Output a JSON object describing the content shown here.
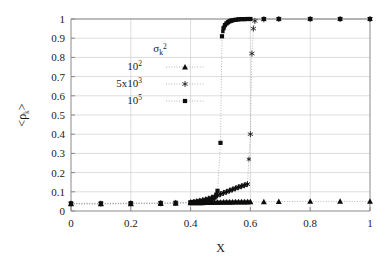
{
  "chart_data": {
    "type": "scatter",
    "title": "",
    "xlabel": "X",
    "ylabel": "<ρk>",
    "ylabel_parts": {
      "open": "<",
      "rho": "ρ",
      "sub": "k",
      "close": ">"
    },
    "xlim": [
      0,
      1
    ],
    "ylim": [
      0,
      1
    ],
    "xticks": [
      "0",
      "0.2",
      "0.4",
      "0.6",
      "0.8",
      "1"
    ],
    "xtick_values": [
      0,
      0.2,
      0.4,
      0.6,
      0.8,
      1
    ],
    "yticks": [
      "0",
      "0.1",
      "0.2",
      "0.3",
      "0.4",
      "0.5",
      "0.6",
      "0.7",
      "0.8",
      "0.9",
      "1"
    ],
    "ytick_values": [
      0,
      0.1,
      0.2,
      0.3,
      0.4,
      0.5,
      0.6,
      0.7,
      0.8,
      0.9,
      1.0
    ],
    "grid": true,
    "grid_color": "#cfcfcf",
    "legend_position": "upper-left-inside",
    "legend_title": "σk²",
    "legend_title_parts": {
      "sigma": "σ",
      "sub": "k",
      "sup": "2"
    },
    "series": [
      {
        "name": "10²",
        "name_parts": {
          "base": "10",
          "exp": "2"
        },
        "marker": "triangle",
        "color": "#0d0d0d",
        "x": [
          0.0,
          0.1,
          0.2,
          0.3,
          0.35,
          0.4,
          0.41,
          0.42,
          0.43,
          0.44,
          0.45,
          0.46,
          0.47,
          0.48,
          0.49,
          0.5,
          0.51,
          0.52,
          0.53,
          0.54,
          0.55,
          0.56,
          0.57,
          0.58,
          0.59,
          0.6,
          0.645,
          0.695,
          0.8,
          0.9,
          1.0
        ],
        "y": [
          0.037,
          0.037,
          0.038,
          0.039,
          0.04,
          0.042,
          0.042,
          0.043,
          0.043,
          0.043,
          0.044,
          0.044,
          0.044,
          0.045,
          0.045,
          0.045,
          0.046,
          0.046,
          0.046,
          0.046,
          0.047,
          0.047,
          0.047,
          0.047,
          0.047,
          0.048,
          0.048,
          0.049,
          0.05,
          0.05,
          0.05
        ]
      },
      {
        "name": "5x10³",
        "name_parts": {
          "base": "5x10",
          "exp": "3"
        },
        "marker": "star",
        "color": "#0d0d0d",
        "x": [
          0.0,
          0.1,
          0.2,
          0.3,
          0.35,
          0.4,
          0.41,
          0.42,
          0.43,
          0.44,
          0.45,
          0.46,
          0.47,
          0.48,
          0.49,
          0.5,
          0.51,
          0.52,
          0.53,
          0.54,
          0.55,
          0.56,
          0.57,
          0.58,
          0.59,
          0.6,
          0.605,
          0.61,
          0.615,
          0.645,
          0.695,
          0.8,
          0.9,
          1.0
        ],
        "y": [
          0.038,
          0.038,
          0.039,
          0.04,
          0.042,
          0.045,
          0.047,
          0.05,
          0.053,
          0.056,
          0.06,
          0.064,
          0.069,
          0.075,
          0.081,
          0.088,
          0.094,
          0.1,
          0.106,
          0.112,
          0.118,
          0.124,
          0.129,
          0.134,
          0.14,
          0.4,
          0.82,
          0.95,
          0.99,
          0.998,
          1.0,
          1.0,
          1.0,
          1.0
        ]
      },
      {
        "name": "10⁵",
        "name_parts": {
          "base": "10",
          "exp": "5"
        },
        "marker": "square",
        "color": "#0d0d0d",
        "x": [
          0.0,
          0.1,
          0.2,
          0.3,
          0.35,
          0.4,
          0.41,
          0.42,
          0.43,
          0.44,
          0.45,
          0.46,
          0.47,
          0.48,
          0.49,
          0.5,
          0.505,
          0.51,
          0.515,
          0.52,
          0.525,
          0.53,
          0.535,
          0.54,
          0.55,
          0.56,
          0.57,
          0.58,
          0.59,
          0.6,
          0.645,
          0.695,
          0.8,
          0.9,
          1.0
        ],
        "y": [
          0.04,
          0.04,
          0.041,
          0.042,
          0.043,
          0.045,
          0.046,
          0.047,
          0.048,
          0.05,
          0.052,
          0.055,
          0.06,
          0.07,
          0.105,
          0.355,
          0.91,
          0.952,
          0.968,
          0.977,
          0.983,
          0.988,
          0.991,
          0.993,
          0.996,
          0.998,
          0.999,
          0.999,
          1.0,
          1.0,
          1.0,
          1.0,
          1.0,
          1.0,
          1.0
        ]
      }
    ],
    "annotations": []
  },
  "figure": {
    "background": "#ffffff",
    "frame_color": "#8a8a8a"
  }
}
